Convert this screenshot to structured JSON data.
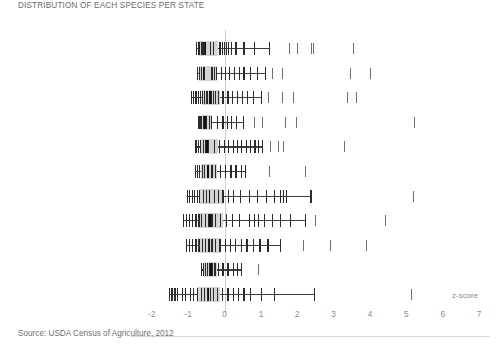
{
  "title": "DISTRIBUTION OF EACH SPECIES PER STATE",
  "source": "Source: USDA Census of Agriculture, 2012",
  "axis": {
    "title": "z-score",
    "ticks": [
      "-2",
      "-1",
      "0",
      "1",
      "2",
      "3",
      "4",
      "5",
      "6",
      "7"
    ],
    "tick_values": [
      -2,
      -1,
      0,
      1,
      2,
      3,
      4,
      5,
      6,
      7
    ],
    "xlim": [
      -2.6,
      7.3
    ],
    "zero_reference": 0
  },
  "colors": {
    "box": "#d4d4d4",
    "marker": "#2b2b2b",
    "outlier": "#6e6e6e",
    "whisker": "#3f3f3f",
    "text": "#6f6f6f",
    "zeroline": "#cfcfcf",
    "axis": "#d9d9d9",
    "background": "#ffffff"
  },
  "chart_data": {
    "type": "box",
    "title": "DISTRIBUTION OF EACH SPECIES PER STATE",
    "xlabel": "z-score",
    "ylabel": "",
    "xlim": [
      -2.6,
      7.3
    ],
    "grid": false,
    "legend": "none",
    "categories": [
      "Broilers",
      "Turkeys",
      "Sheep and lambs",
      "Hogs and pigs",
      "Milk cows",
      "Colonies of bees",
      "Beef cows",
      "Cattle and calves",
      "Population",
      "All goats",
      "Horses and ponies"
    ],
    "series": [
      {
        "name": "Broilers",
        "q1": -0.72,
        "median": -0.55,
        "q3": -0.17,
        "whisker_low": -0.78,
        "whisker_high": 1.22,
        "points": [
          -0.78,
          -0.74,
          -0.7,
          -0.66,
          -0.62,
          -0.58,
          -0.4,
          -0.32,
          -0.14,
          -0.08,
          -0.02,
          0.04,
          0.1,
          0.18,
          0.3,
          0.52,
          0.8,
          1.22
        ],
        "outliers": [
          1.78,
          2.0,
          2.38,
          2.44,
          3.52
        ]
      },
      {
        "name": "Turkeys",
        "q1": -0.7,
        "median": -0.6,
        "q3": -0.22,
        "whisker_low": -0.76,
        "whisker_high": 1.1,
        "points": [
          -0.76,
          -0.7,
          -0.64,
          -0.58,
          -0.36,
          -0.3,
          -0.24,
          -0.1,
          0.0,
          0.12,
          0.26,
          0.4,
          0.52,
          0.7,
          0.88,
          1.1
        ],
        "outliers": [
          1.3,
          1.58,
          3.44,
          4.0
        ]
      },
      {
        "name": "Sheep and lambs",
        "q1": -0.62,
        "median": -0.42,
        "q3": -0.12,
        "whisker_low": -0.92,
        "whisker_high": 1.0,
        "points": [
          -0.92,
          -0.86,
          -0.8,
          -0.74,
          -0.68,
          -0.62,
          -0.56,
          -0.5,
          -0.44,
          -0.38,
          -0.32,
          -0.26,
          -0.18,
          -0.06,
          0.08,
          0.2,
          0.34,
          0.48,
          0.62,
          0.78,
          1.0
        ],
        "outliers": [
          1.2,
          1.58,
          1.88,
          3.38,
          3.62
        ]
      },
      {
        "name": "Hogs and pigs",
        "q1": -0.62,
        "median": -0.56,
        "q3": -0.34,
        "whisker_low": -0.72,
        "whisker_high": 0.5,
        "points": [
          -0.72,
          -0.68,
          -0.64,
          -0.6,
          -0.52,
          -0.44,
          -0.38,
          -0.2,
          -0.06,
          0.06,
          0.18,
          0.32,
          0.5
        ],
        "outliers": [
          0.82,
          1.02,
          1.66,
          1.96,
          5.2
        ]
      },
      {
        "name": "Milk cows",
        "q1": -0.64,
        "median": -0.5,
        "q3": -0.18,
        "whisker_low": -0.8,
        "whisker_high": 1.02,
        "points": [
          -0.8,
          -0.74,
          -0.68,
          -0.6,
          -0.54,
          -0.46,
          -0.3,
          -0.16,
          -0.02,
          0.1,
          0.22,
          0.34,
          0.46,
          0.58,
          0.7,
          0.82,
          0.92,
          1.02
        ],
        "outliers": [
          1.26,
          1.46,
          1.6,
          3.28
        ]
      },
      {
        "name": "Colonies of bees",
        "q1": -0.66,
        "median": -0.48,
        "q3": -0.2,
        "whisker_low": -0.82,
        "whisker_high": 0.56,
        "points": [
          -0.82,
          -0.76,
          -0.7,
          -0.62,
          -0.56,
          -0.48,
          -0.36,
          -0.26,
          -0.12,
          0.02,
          0.16,
          0.3,
          0.44,
          0.56
        ],
        "outliers": [
          1.22,
          2.2
        ]
      },
      {
        "name": "Beef cows",
        "q1": -0.7,
        "median": -0.44,
        "q3": -0.04,
        "whisker_low": -1.04,
        "whisker_high": 2.36,
        "points": [
          -1.04,
          -0.98,
          -0.9,
          -0.84,
          -0.76,
          -0.7,
          -0.6,
          -0.52,
          -0.44,
          -0.3,
          -0.18,
          -0.06,
          0.1,
          0.24,
          0.42,
          0.66,
          0.9,
          1.14,
          1.36,
          1.52,
          1.6,
          1.68,
          2.36
        ],
        "outliers": [
          5.18
        ]
      },
      {
        "name": "Cattle and calves",
        "q1": -0.72,
        "median": -0.42,
        "q3": -0.04,
        "whisker_low": -1.14,
        "whisker_high": 2.22,
        "points": [
          -1.14,
          -1.06,
          -0.98,
          -0.9,
          -0.8,
          -0.72,
          -0.64,
          -0.54,
          -0.46,
          -0.36,
          -0.26,
          -0.12,
          0.04,
          0.2,
          0.4,
          0.66,
          0.8,
          0.92,
          1.08,
          1.3,
          1.52,
          1.8,
          2.22
        ],
        "outliers": [
          2.5,
          4.42
        ]
      },
      {
        "name": "Population",
        "q1": -0.7,
        "median": -0.44,
        "q3": -0.1,
        "whisker_low": -1.06,
        "whisker_high": 1.52,
        "points": [
          -1.06,
          -0.98,
          -0.9,
          -0.8,
          -0.72,
          -0.62,
          -0.54,
          -0.46,
          -0.36,
          -0.26,
          -0.14,
          0.0,
          0.14,
          0.28,
          0.44,
          0.6,
          0.78,
          0.96,
          1.18,
          1.52
        ],
        "outliers": [
          2.16,
          2.9,
          3.88
        ]
      },
      {
        "name": "All goats",
        "q1": -0.56,
        "median": -0.4,
        "q3": -0.22,
        "whisker_low": -0.66,
        "whisker_high": 0.46,
        "points": [
          -0.66,
          -0.6,
          -0.54,
          -0.48,
          -0.42,
          -0.36,
          -0.28,
          -0.18,
          -0.06,
          0.08,
          0.22,
          0.34,
          0.46
        ],
        "outliers": [
          0.92
        ]
      },
      {
        "name": "Horses and ponies",
        "q1": -0.76,
        "median": -0.46,
        "q3": -0.12,
        "whisker_low": -1.54,
        "whisker_high": 2.46,
        "points": [
          -1.54,
          -1.46,
          -1.38,
          -1.3,
          -1.18,
          -1.1,
          -0.96,
          -0.86,
          -0.76,
          -0.66,
          -0.56,
          -0.48,
          -0.4,
          -0.32,
          -0.22,
          -0.08,
          0.08,
          0.22,
          0.36,
          0.52,
          0.7,
          1.0,
          1.36,
          2.46
        ],
        "outliers": [
          5.12
        ]
      }
    ]
  }
}
